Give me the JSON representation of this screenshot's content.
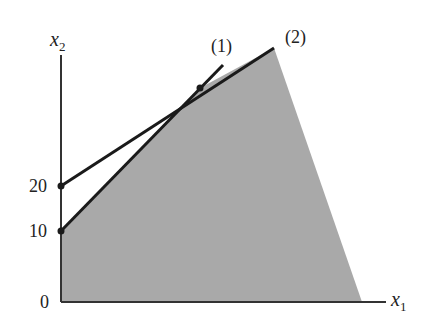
{
  "diagram": {
    "type": "linear-programming-feasible-region",
    "axes": {
      "x_label": "x",
      "x_subscript": "1",
      "y_label": "x",
      "y_subscript": "2",
      "origin_label": "0",
      "y_ticks": [
        "10",
        "20"
      ]
    },
    "constraints": [
      {
        "label": "(1)",
        "y_intercept": 10
      },
      {
        "label": "(2)",
        "y_intercept": 20
      }
    ],
    "colors": {
      "feasible_region": "#a9a9a9",
      "lines": "#1a1a1a",
      "axes": "#333333",
      "background": "#ffffff"
    }
  }
}
